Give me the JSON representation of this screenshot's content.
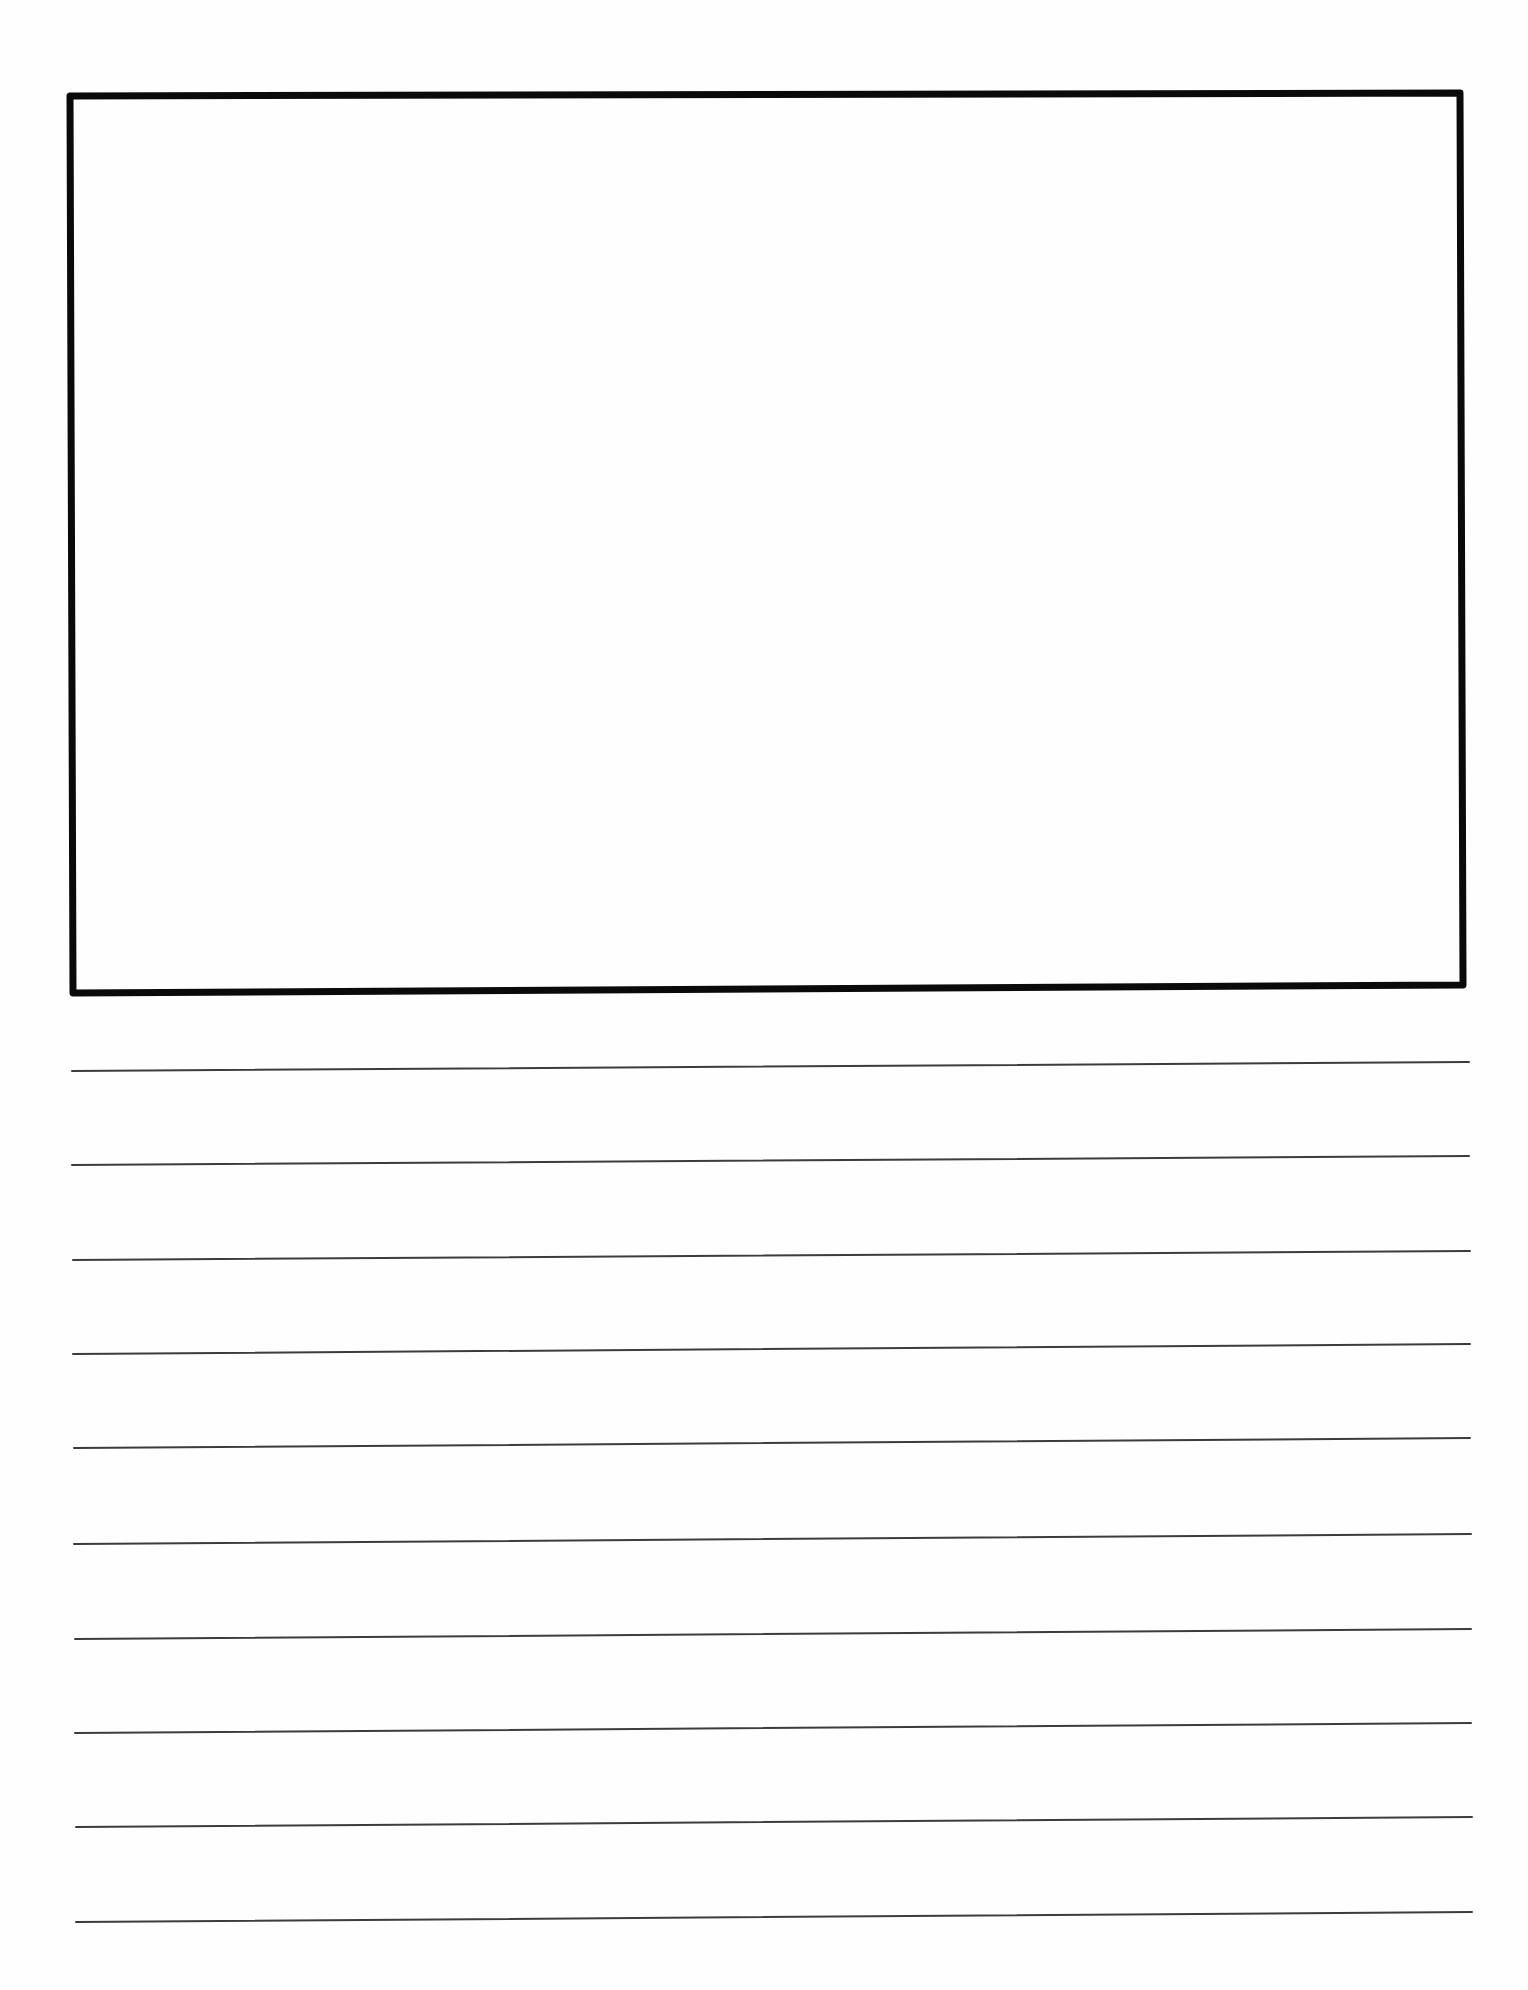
{
  "page": {
    "width": 1528,
    "height": 1990,
    "background": "#fefefe"
  },
  "drawing_box": {
    "label": "",
    "stroke_color": "#0a0a0a",
    "stroke_width": 7,
    "corners": {
      "top_left": [
        70,
        96
      ],
      "top_right": [
        1460,
        93
      ],
      "bottom_right": [
        1463,
        985
      ],
      "bottom_left": [
        73,
        993
      ]
    }
  },
  "writing_lines": {
    "stroke_color": "#3c3c3c",
    "stroke_width": 2,
    "lines": [
      {
        "x1": 72,
        "y1": 1071,
        "x2": 1469,
        "y2": 1062
      },
      {
        "x1": 72,
        "y1": 1165,
        "x2": 1469,
        "y2": 1156
      },
      {
        "x1": 73,
        "y1": 1260,
        "x2": 1470,
        "y2": 1251
      },
      {
        "x1": 73,
        "y1": 1354,
        "x2": 1470,
        "y2": 1344
      },
      {
        "x1": 74,
        "y1": 1448,
        "x2": 1470,
        "y2": 1438
      },
      {
        "x1": 74,
        "y1": 1544,
        "x2": 1471,
        "y2": 1534
      },
      {
        "x1": 75,
        "y1": 1639,
        "x2": 1471,
        "y2": 1629
      },
      {
        "x1": 75,
        "y1": 1733,
        "x2": 1471,
        "y2": 1723
      },
      {
        "x1": 76,
        "y1": 1827,
        "x2": 1472,
        "y2": 1817
      },
      {
        "x1": 76,
        "y1": 1922,
        "x2": 1472,
        "y2": 1912
      }
    ]
  }
}
